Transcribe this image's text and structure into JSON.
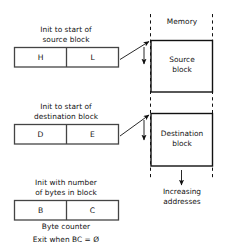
{
  "figure": {
    "title_memory": "Memory",
    "registers": [
      {
        "id": "hl",
        "caption_line1": "Init to start of",
        "caption_line2": "source block",
        "left_cell": "H",
        "right_cell": "L"
      },
      {
        "id": "de",
        "caption_line1": "Init to start of",
        "caption_line2": "destination block",
        "left_cell": "D",
        "right_cell": "E"
      },
      {
        "id": "bc",
        "caption_line1": "Init with number",
        "caption_line2": "of bytes in block",
        "left_cell": "B",
        "right_cell": "C",
        "footer_line1": "Byte counter",
        "footer_line2": "Exit when BC = Ø"
      }
    ],
    "memory_blocks": [
      {
        "id": "source",
        "line1": "Source",
        "line2": "block"
      },
      {
        "id": "destination",
        "line1": "Destination",
        "line2": "block"
      }
    ],
    "address_note": {
      "line1": "Increasing",
      "line2": "addresses"
    },
    "colors": {
      "stroke": "#111111",
      "text": "#111111",
      "background": "#ffffff"
    }
  }
}
